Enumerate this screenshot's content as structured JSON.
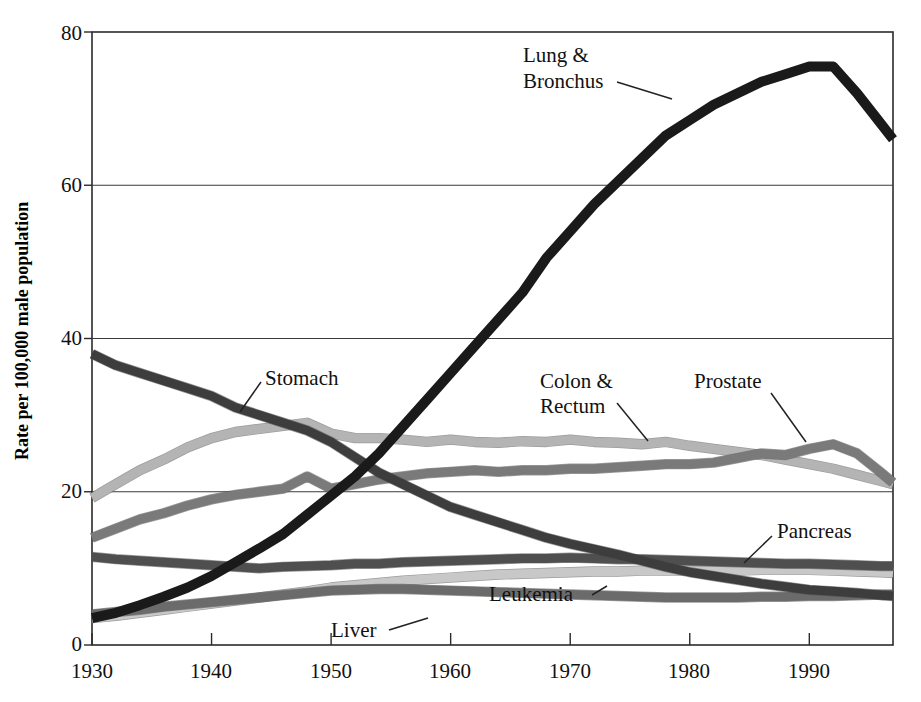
{
  "chart_data": {
    "type": "line",
    "title": "",
    "subtitle": "",
    "xlabel": "",
    "ylabel": "Rate per 100,000 male population",
    "xlim": [
      1930,
      1997
    ],
    "ylim": [
      0,
      80
    ],
    "yticks": [
      0,
      20,
      40,
      60,
      80
    ],
    "ytick_labels": [
      "0",
      "20",
      "40",
      "60",
      "80"
    ],
    "xticks": [
      1930,
      1940,
      1950,
      1960,
      1970,
      1980,
      1990
    ],
    "xtick_labels": [
      "1930",
      "1940",
      "1950",
      "1960",
      "1970",
      "1980",
      "1990"
    ],
    "grid": "horizontal-gridlines-at-20-40-60",
    "legend": "inline-annotations-with-leader-lines",
    "x": [
      1930,
      1932,
      1934,
      1936,
      1938,
      1940,
      1942,
      1944,
      1946,
      1948,
      1950,
      1952,
      1954,
      1956,
      1958,
      1960,
      1962,
      1964,
      1966,
      1968,
      1970,
      1972,
      1974,
      1976,
      1978,
      1980,
      1982,
      1984,
      1986,
      1988,
      1990,
      1992,
      1994,
      1996,
      1997
    ],
    "series": [
      {
        "name": "Lung & Bronchus",
        "color": "#1a1a1a",
        "label": "Lung & Bronchus",
        "values": [
          3.5,
          4.2,
          5.2,
          6.3,
          7.5,
          9.0,
          10.8,
          12.6,
          14.5,
          17.0,
          19.5,
          22.0,
          25.0,
          28.5,
          32.0,
          35.5,
          39.0,
          42.5,
          46.0,
          50.5,
          54.0,
          57.5,
          60.5,
          63.5,
          66.5,
          68.5,
          70.5,
          72.0,
          73.5,
          74.5,
          75.5,
          75.5,
          72.0,
          68.0,
          66.0
        ]
      },
      {
        "name": "Stomach",
        "color": "#3d3d3d",
        "label": "Stomach",
        "values": [
          38.0,
          36.5,
          35.5,
          34.5,
          33.5,
          32.5,
          31.0,
          30.0,
          29.0,
          28.0,
          26.5,
          24.5,
          22.5,
          21.0,
          19.5,
          18.0,
          17.0,
          16.0,
          15.0,
          14.0,
          13.2,
          12.5,
          11.8,
          11.0,
          10.2,
          9.5,
          9.0,
          8.5,
          8.0,
          7.6,
          7.2,
          7.0,
          6.8,
          6.5,
          6.4
        ]
      },
      {
        "name": "Colon & Rectum",
        "color": "#b4b4b4",
        "label": "Colon & Rectum",
        "values": [
          19.2,
          21.0,
          22.8,
          24.2,
          25.8,
          27.0,
          27.8,
          28.2,
          28.6,
          29.0,
          27.6,
          27.0,
          27.0,
          26.8,
          26.5,
          26.8,
          26.5,
          26.4,
          26.6,
          26.5,
          26.8,
          26.5,
          26.4,
          26.2,
          26.5,
          26.0,
          25.6,
          25.2,
          24.8,
          24.2,
          23.6,
          23.0,
          22.2,
          21.4,
          21.0
        ]
      },
      {
        "name": "Prostate",
        "color": "#7a7a7a",
        "label": "Prostate",
        "values": [
          14.0,
          15.2,
          16.4,
          17.2,
          18.2,
          19.0,
          19.6,
          20.0,
          20.4,
          22.0,
          20.4,
          21.0,
          21.6,
          22.0,
          22.4,
          22.6,
          22.8,
          22.6,
          22.8,
          22.8,
          23.0,
          23.0,
          23.2,
          23.4,
          23.6,
          23.6,
          23.8,
          24.4,
          25.0,
          24.8,
          25.6,
          26.2,
          25.0,
          22.5,
          21.2
        ]
      },
      {
        "name": "Pancreas",
        "color": "#4f4f4f",
        "label": "Pancreas",
        "values": [
          11.5,
          11.2,
          11.0,
          10.8,
          10.6,
          10.4,
          10.2,
          10.0,
          10.2,
          10.3,
          10.4,
          10.6,
          10.6,
          10.8,
          10.9,
          11.0,
          11.1,
          11.2,
          11.3,
          11.3,
          11.4,
          11.3,
          11.2,
          11.2,
          11.1,
          11.0,
          10.9,
          10.8,
          10.7,
          10.6,
          10.6,
          10.5,
          10.4,
          10.3,
          10.3
        ]
      },
      {
        "name": "Leukemia",
        "color": "#c8c8c8",
        "label": "Leukemia",
        "values": [
          3.5,
          3.8,
          4.2,
          4.6,
          5.0,
          5.4,
          5.8,
          6.2,
          6.6,
          7.0,
          7.5,
          7.8,
          8.1,
          8.4,
          8.6,
          8.8,
          9.0,
          9.2,
          9.3,
          9.4,
          9.5,
          9.6,
          9.6,
          9.7,
          9.7,
          9.7,
          9.7,
          9.7,
          9.8,
          9.8,
          9.8,
          9.7,
          9.6,
          9.5,
          9.4
        ]
      },
      {
        "name": "Liver",
        "color": "#6b6b6b",
        "label": "Liver",
        "values": [
          4.0,
          4.3,
          4.6,
          5.0,
          5.3,
          5.6,
          5.9,
          6.2,
          6.5,
          6.8,
          7.1,
          7.2,
          7.3,
          7.3,
          7.2,
          7.1,
          7.0,
          6.9,
          6.8,
          6.7,
          6.6,
          6.5,
          6.4,
          6.3,
          6.2,
          6.2,
          6.2,
          6.2,
          6.3,
          6.3,
          6.4,
          6.4,
          6.5,
          6.6,
          6.6
        ]
      }
    ],
    "annotations": [
      {
        "text_line1": "Lung &",
        "text_line2": "Bronchus",
        "name": "lung-bronchus-label"
      },
      {
        "text_line1": "Stomach",
        "text_line2": "",
        "name": "stomach-label"
      },
      {
        "text_line1": "Colon &",
        "text_line2": "Rectum",
        "name": "colon-rectum-label"
      },
      {
        "text_line1": "Prostate",
        "text_line2": "",
        "name": "prostate-label"
      },
      {
        "text_line1": "Pancreas",
        "text_line2": "",
        "name": "pancreas-label"
      },
      {
        "text_line1": "Leukemia",
        "text_line2": "",
        "name": "leukemia-label"
      },
      {
        "text_line1": "Liver",
        "text_line2": "",
        "name": "liver-label"
      }
    ]
  },
  "labels": {
    "y_axis_title": "Rate per 100,000 male population",
    "lung_line1": "Lung &",
    "lung_line2": "Bronchus",
    "stomach": "Stomach",
    "colon_line1": "Colon &",
    "colon_line2": "Rectum",
    "prostate": "Prostate",
    "pancreas": "Pancreas",
    "leukemia": "Leukemia",
    "liver": "Liver",
    "y0": "0",
    "y20": "20",
    "y40": "40",
    "y60": "60",
    "y80": "80",
    "x1930": "1930",
    "x1940": "1940",
    "x1950": "1950",
    "x1960": "1960",
    "x1970": "1970",
    "x1980": "1980",
    "x1990": "1990"
  }
}
